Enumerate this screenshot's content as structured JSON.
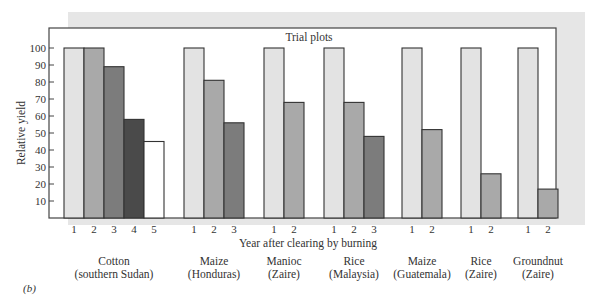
{
  "panel_label": "(b)",
  "chart_data": {
    "type": "bar",
    "title": "Trial plots",
    "xlabel": "Year after clearing by burning",
    "ylabel": "Relative yield",
    "ylim": [
      0,
      105
    ],
    "yticks": [
      10,
      20,
      30,
      40,
      50,
      60,
      70,
      80,
      90,
      100
    ],
    "grid": false,
    "groups": [
      {
        "label": [
          "Cotton",
          "(southern Sudan)"
        ],
        "years": [
          "1",
          "2",
          "3",
          "4",
          "5"
        ],
        "values": [
          100,
          100,
          89,
          58,
          45
        ]
      },
      {
        "label": [
          "Maize",
          "(Honduras)"
        ],
        "years": [
          "1",
          "2",
          "3"
        ],
        "values": [
          100,
          81,
          56
        ]
      },
      {
        "label": [
          "Manioc",
          "(Zaire)"
        ],
        "years": [
          "1",
          "2"
        ],
        "values": [
          100,
          68
        ]
      },
      {
        "label": [
          "Rice",
          "(Malaysia)"
        ],
        "years": [
          "1",
          "2",
          "3"
        ],
        "values": [
          100,
          68,
          48
        ]
      },
      {
        "label": [
          "Maize",
          "(Guatemala)"
        ],
        "years": [
          "1",
          "2"
        ],
        "values": [
          100,
          52
        ]
      },
      {
        "label": [
          "Rice",
          "(Zaire)"
        ],
        "years": [
          "1",
          "2"
        ],
        "values": [
          100,
          26
        ]
      },
      {
        "label": [
          "Groundnut",
          "(Zaire)"
        ],
        "years": [
          "1",
          "2"
        ],
        "values": [
          100,
          17
        ]
      }
    ],
    "year_colors": [
      "#e3e3e3",
      "#a9a9a9",
      "#7c7c7c",
      "#4a4a4a",
      "#ffffff"
    ],
    "shadow_color": "#e6e6e6"
  }
}
